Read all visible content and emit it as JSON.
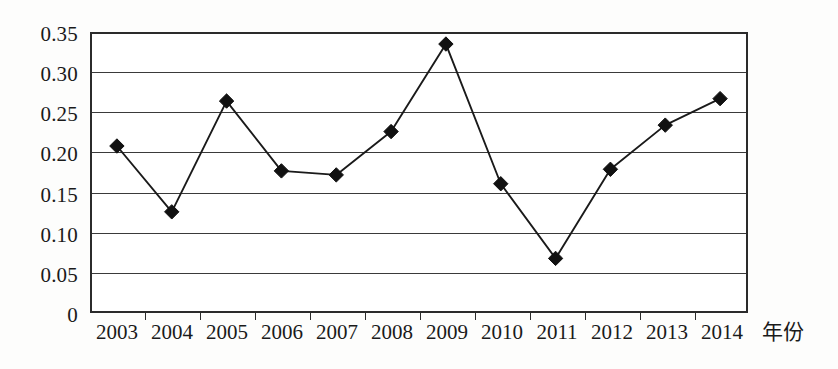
{
  "chart_data": {
    "type": "line",
    "title": "",
    "subtitle": "",
    "xlabel": "年份",
    "ylabel": "",
    "categories": [
      "2003",
      "2004",
      "2005",
      "2006",
      "2007",
      "2008",
      "2009",
      "2010",
      "2011",
      "2012",
      "2013",
      "2014"
    ],
    "values": [
      0.208,
      0.126,
      0.264,
      0.177,
      0.172,
      0.226,
      0.335,
      0.161,
      0.068,
      0.179,
      0.234,
      0.267
    ],
    "series": [
      {
        "name": "series-1",
        "values": [
          0.208,
          0.126,
          0.264,
          0.177,
          0.172,
          0.226,
          0.335,
          0.161,
          0.068,
          0.179,
          0.234,
          0.267
        ]
      }
    ],
    "ylim": [
      0,
      0.35
    ],
    "yticks": [
      "0",
      "0.05",
      "0.10",
      "0.15",
      "0.20",
      "0.25",
      "0.30",
      "0.35"
    ],
    "ytick_values": [
      0,
      0.05,
      0.1,
      0.15,
      0.2,
      0.25,
      0.3,
      0.35
    ],
    "grid": true,
    "grid_axis": "y",
    "legend": false,
    "legend_position": "none",
    "marker": "diamond",
    "line_color": "#1a1a1a",
    "marker_color": "#111111",
    "grid_color": "#3a3a3a",
    "frame_color": "#2b2b2b",
    "background_color": "#ffffff"
  },
  "axes": {
    "x_title": "年份",
    "x_tick_labels": [
      "2003",
      "2004",
      "2005",
      "2006",
      "2007",
      "2008",
      "2009",
      "2010",
      "2011",
      "2012",
      "2013",
      "2014"
    ],
    "y_tick_labels": [
      "0.35",
      "0.30",
      "0.25",
      "0.20",
      "0.15",
      "0.10",
      "0.05",
      "0"
    ]
  }
}
